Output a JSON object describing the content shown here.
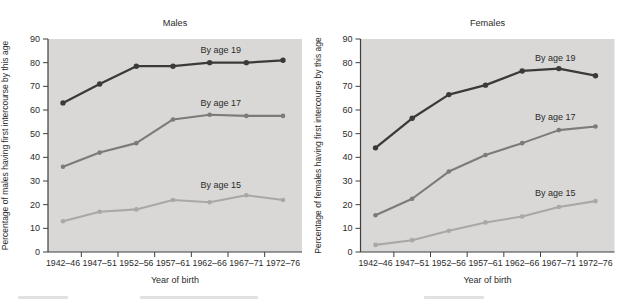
{
  "chart_data": [
    {
      "type": "line",
      "title": "Males",
      "xlabel": "Year of birth",
      "ylabel": "Percentage of males having first intercourse by this age",
      "ylim": [
        0,
        90
      ],
      "ytick_step": 10,
      "grid": false,
      "legend_position": "inline-annotations",
      "plot_bg": "#d9d8d6",
      "categories": [
        "1942–46",
        "1947–51",
        "1952–56",
        "1957–61",
        "1962–66",
        "1967–71",
        "1972–76"
      ],
      "series": [
        {
          "name": "By age 19",
          "color": "#3a3a3a",
          "values": [
            63,
            71,
            78.5,
            78.5,
            80,
            80,
            81
          ]
        },
        {
          "name": "By age 17",
          "color": "#7b7b7b",
          "values": [
            36,
            42,
            46,
            56,
            58,
            57.5,
            57.5
          ]
        },
        {
          "name": "By age 15",
          "color": "#a8a8a6",
          "values": [
            13,
            17,
            18,
            22,
            21,
            24,
            22
          ]
        }
      ],
      "annotations": [
        {
          "text": "By age 19",
          "x_index": 4.3,
          "y_value": 85.5
        },
        {
          "text": "By age 17",
          "x_index": 4.3,
          "y_value": 63
        },
        {
          "text": "By age 15",
          "x_index": 4.3,
          "y_value": 28.5
        }
      ]
    },
    {
      "type": "line",
      "title": "Females",
      "xlabel": "Year of birth",
      "ylabel": "Percentage of females having first intercourse by this age",
      "ylim": [
        0,
        90
      ],
      "ytick_step": 10,
      "grid": false,
      "legend_position": "inline-annotations",
      "plot_bg": "#d9d8d6",
      "categories": [
        "1942–46",
        "1947–51",
        "1952–56",
        "1957–61",
        "1962–66",
        "1967–71",
        "1972–76"
      ],
      "series": [
        {
          "name": "By age 19",
          "color": "#3a3a3a",
          "values": [
            44,
            56.5,
            66.5,
            70.5,
            76.5,
            77.5,
            74.5
          ]
        },
        {
          "name": "By age 17",
          "color": "#7b7b7b",
          "values": [
            15.5,
            22.5,
            34,
            41,
            46,
            51.5,
            53
          ]
        },
        {
          "name": "By age 15",
          "color": "#a8a8a6",
          "values": [
            3,
            5,
            9,
            12.5,
            15,
            19,
            21.5
          ]
        }
      ],
      "annotations": [
        {
          "text": "By age 19",
          "x_index": 4.9,
          "y_value": 82
        },
        {
          "text": "By age 17",
          "x_index": 4.9,
          "y_value": 57
        },
        {
          "text": "By age 15",
          "x_index": 4.9,
          "y_value": 25
        }
      ]
    }
  ],
  "colors": {
    "axis": "#3f3f3f",
    "text": "#2b2b2b",
    "plot_bg": "#d9d8d6"
  }
}
